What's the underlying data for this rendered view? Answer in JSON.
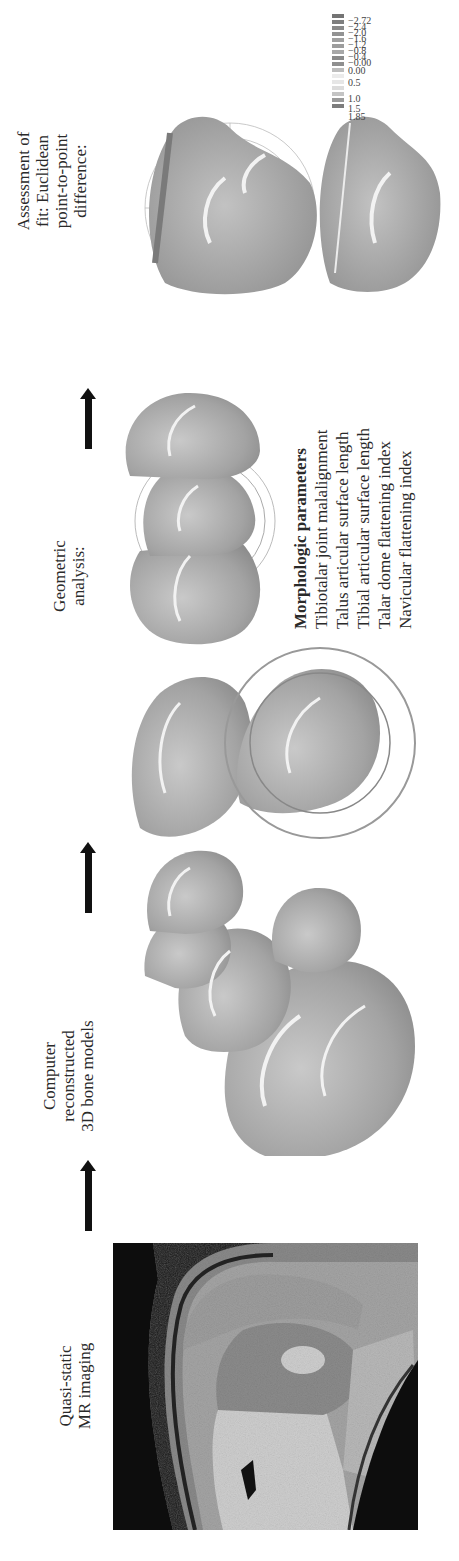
{
  "figure": {
    "steps": [
      {
        "id": "mr",
        "label_lines": [
          "Quasi-static",
          "MR imaging"
        ]
      },
      {
        "id": "recon",
        "label_lines": [
          "Computer",
          "reconstructed",
          "3D bone models"
        ]
      },
      {
        "id": "geom",
        "label_lines": [
          "Geometric",
          "analysis:"
        ]
      },
      {
        "id": "assess",
        "label_lines": [
          "Assessment of",
          "fit: Euclidean",
          "point-to-point",
          "difference:"
        ]
      }
    ],
    "morphologic": {
      "title": "Morphologic parameters",
      "items": [
        "Tibiotalar joint malalignment",
        "Talus articular surface length",
        "Tibial articular surface length",
        "Talar dome flattening index",
        "Navicular flattening index"
      ]
    },
    "legend": {
      "values": [
        "1.85",
        "1.5",
        "1.0",
        "",
        "0.5",
        "",
        "0.00",
        "−0.00",
        "−0.4",
        "−0.8",
        "−1.2",
        "−1.6",
        "−2.0",
        "−2.4",
        "−2.72"
      ],
      "colors": [
        "#7d7d7d",
        "#9a9a9a",
        "#c4c4c4",
        "#dcdcdc",
        "#e6e6e6",
        "#bdbdbd",
        "#8f8f8f",
        "#8a8a8a",
        "#a8a8a8",
        "#9d9d9d",
        "#a0a0a0",
        "#939393",
        "#8a8a8a",
        "#7f7f7f",
        "#747474"
      ],
      "unit": "mm"
    },
    "colors": {
      "bone": "#a9a9a9",
      "bone_highlight": "#eeeeee",
      "arrow": "#111111",
      "mri_bg": "#1a1a1a"
    }
  }
}
